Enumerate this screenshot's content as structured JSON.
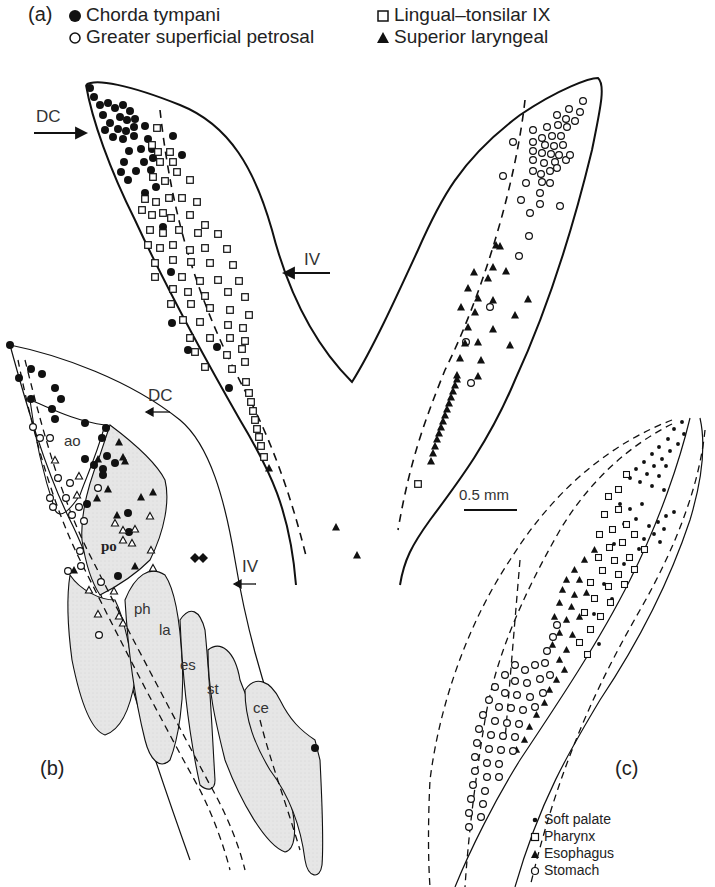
{
  "figure": {
    "panels": {
      "a": {
        "tag": "(a)"
      },
      "b": {
        "tag": "(b)"
      },
      "c": {
        "tag": "(c)"
      }
    },
    "legend_a": [
      {
        "symbol": "filled-circle",
        "label": "Chorda tympani"
      },
      {
        "symbol": "open-circle",
        "label": "Greater superficial petrosal"
      },
      {
        "symbol": "open-square",
        "label": "Lingual–tonsilar IX"
      },
      {
        "symbol": "filled-triangle",
        "label": "Superior laryngeal"
      }
    ],
    "legend_c": [
      {
        "symbol": "small-dot",
        "label": "Soft palate"
      },
      {
        "symbol": "open-square",
        "label": "Pharynx"
      },
      {
        "symbol": "filled-triangle",
        "label": "Esophagus"
      },
      {
        "symbol": "open-circle",
        "label": "Stomach"
      }
    ],
    "direction_labels": {
      "a_left": "DC",
      "a_right": "IV",
      "b_top": "DC",
      "b_bottom": "IV"
    },
    "subnucleus_labels": {
      "ao": "ao",
      "po": "po",
      "ph": "ph",
      "la": "la",
      "es": "es",
      "st": "st",
      "ce": "ce"
    },
    "scale_bar": {
      "label": "0.5 mm"
    },
    "colors": {
      "ink": "#1a1a1a",
      "shading": "#e3e3e3",
      "background": "#ffffff"
    }
  }
}
